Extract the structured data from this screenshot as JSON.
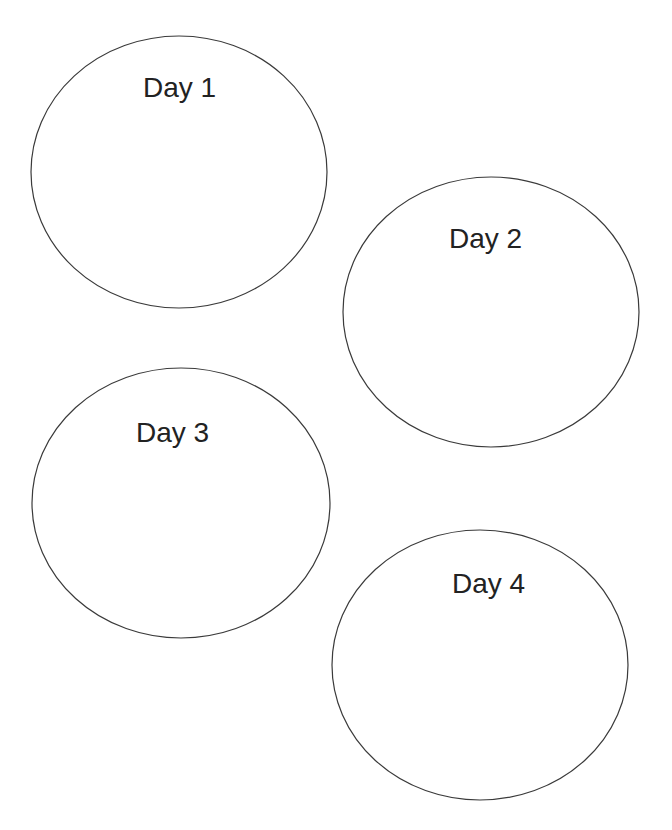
{
  "colors": {
    "background": "#ffffff",
    "stroke": "#3a3a3a",
    "text": "#222222"
  },
  "circles": [
    {
      "label": "Day 1",
      "cx": 179,
      "cy": 172,
      "rx": 148,
      "ry": 136,
      "label_x": 143,
      "label_y": 74
    },
    {
      "label": "Day 2",
      "cx": 491,
      "cy": 312,
      "rx": 148,
      "ry": 135,
      "label_x": 449,
      "label_y": 225
    },
    {
      "label": "Day 3",
      "cx": 181,
      "cy": 503,
      "rx": 149,
      "ry": 135,
      "label_x": 136,
      "label_y": 419
    },
    {
      "label": "Day 4",
      "cx": 480,
      "cy": 665,
      "rx": 148,
      "ry": 135,
      "label_x": 452,
      "label_y": 570
    }
  ]
}
